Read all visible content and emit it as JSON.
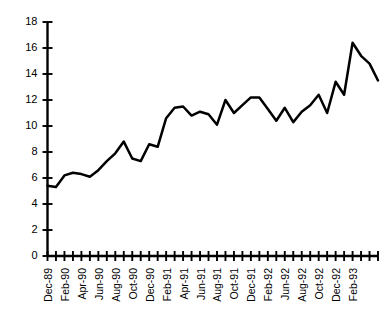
{
  "chart_data": {
    "type": "line",
    "title": "",
    "subtitle": "",
    "xlabel": "",
    "ylabel": "",
    "ylim": [
      0,
      18
    ],
    "ytick_labels": [
      "0",
      "2",
      "4",
      "6",
      "8",
      "10",
      "12",
      "14",
      "16",
      "18"
    ],
    "ytick_values": [
      0,
      2,
      4,
      6,
      8,
      10,
      12,
      14,
      16,
      18
    ],
    "grid": false,
    "legend": false,
    "legend_position": "none",
    "line_color": "#000000",
    "background_color": "#ffffff",
    "xtick_label_interval": 2,
    "xtick_labels_visible": [
      "Dec-89",
      "Feb-90",
      "Apr-90",
      "Jun-90",
      "Aug-90",
      "Oct-90",
      "Dec-90",
      "Feb-91",
      "Apr-91",
      "Jun-91",
      "Aug-91",
      "Oct-91",
      "Dec-91",
      "Feb-92",
      "Jun-92",
      "Aug-92",
      "Oct-92",
      "Dec-92",
      "Feb-93"
    ],
    "categories": [
      "Dec-89",
      "Jan-90",
      "Feb-90",
      "Mar-90",
      "Apr-90",
      "May-90",
      "Jun-90",
      "Jul-90",
      "Aug-90",
      "Sep-90",
      "Oct-90",
      "Nov-90",
      "Dec-90",
      "Jan-91",
      "Feb-91",
      "Mar-91",
      "Apr-91",
      "May-91",
      "Jun-91",
      "Jul-91",
      "Aug-91",
      "Sep-91",
      "Oct-91",
      "Nov-91",
      "Dec-91",
      "Jan-92",
      "Feb-92",
      "Mar-92",
      "Apr-92",
      "May-92",
      "Jun-92",
      "Jul-92",
      "Aug-92",
      "Sep-92",
      "Oct-92",
      "Nov-92",
      "Dec-92",
      "Jan-93",
      "Feb-93",
      "Mar-93"
    ],
    "values": [
      5.4,
      5.3,
      6.2,
      6.4,
      6.3,
      6.1,
      6.6,
      7.3,
      7.9,
      8.8,
      7.5,
      7.3,
      8.6,
      8.4,
      10.6,
      11.4,
      11.5,
      10.8,
      11.1,
      10.9,
      10.1,
      12.0,
      11.0,
      11.6,
      12.2,
      12.2,
      11.3,
      10.4,
      11.4,
      10.3,
      11.1,
      11.6,
      12.4,
      11.0,
      13.4,
      12.4,
      16.4,
      15.4,
      14.8,
      13.5
    ],
    "series_name": "value"
  }
}
